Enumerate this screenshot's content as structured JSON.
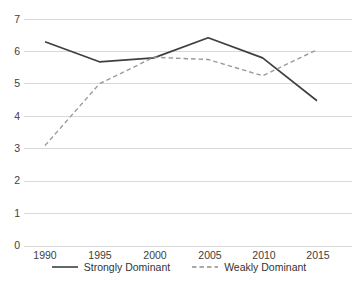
{
  "chart_data": {
    "type": "line",
    "title": "",
    "xlabel": "",
    "ylabel": "",
    "categories": [
      1990,
      1995,
      2000,
      2005,
      2010,
      2015
    ],
    "x_tick_labels": [
      "1990",
      "1995",
      "2000",
      "2005",
      "2010",
      "2015"
    ],
    "y_tick_labels": [
      "0",
      "1",
      "2",
      "3",
      "4",
      "5",
      "6",
      "7"
    ],
    "y_ticks": [
      0,
      1,
      2,
      3,
      4,
      5,
      6,
      7
    ],
    "ylim": [
      0,
      7
    ],
    "xlim": [
      1988.5,
      2016.5
    ],
    "grid": "horizontal",
    "legend_position": "bottom-center",
    "series": [
      {
        "name": "Strongly Dominant",
        "style": "solid",
        "color": "#3f3f3f",
        "values": [
          6.3,
          5.68,
          5.8,
          6.42,
          5.8,
          4.48
        ]
      },
      {
        "name": "Weakly Dominant",
        "style": "dashed",
        "color": "#9a9a9a",
        "values": [
          3.1,
          5.0,
          5.82,
          5.75,
          5.25,
          6.05
        ]
      }
    ]
  },
  "legend": {
    "items": [
      {
        "label": "Strongly Dominant",
        "swatch": "solid-line-swatch"
      },
      {
        "label": "Weakly Dominant",
        "swatch": "dashed-line-swatch"
      }
    ]
  },
  "axes": {
    "y_labels": [
      "7",
      "6",
      "5",
      "4",
      "3",
      "2",
      "1",
      "0"
    ],
    "x_labels": [
      "1990",
      "1995",
      "2000",
      "2005",
      "2010",
      "2015"
    ]
  },
  "colors": {
    "gridline": "#d9d9d9",
    "series_strong": "#3f3f3f",
    "series_weak": "#9a9a9a",
    "text": "#404040",
    "background": "#ffffff"
  }
}
